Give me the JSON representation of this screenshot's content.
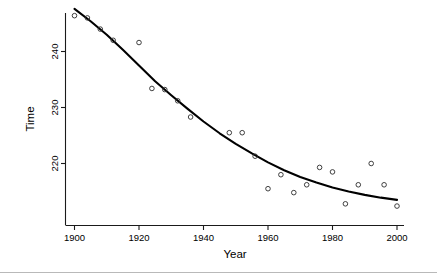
{
  "chart_data": {
    "type": "scatter",
    "title": "",
    "xlabel": "Year",
    "ylabel": "Time",
    "xlim": [
      1896,
      2004
    ],
    "ylim": [
      212,
      247
    ],
    "grid": false,
    "legend": null,
    "xticks": [
      1900,
      1920,
      1940,
      1960,
      1980,
      2000
    ],
    "xtick_labels": [
      "1900",
      "1920",
      "1940",
      "1960",
      "1980",
      "2000"
    ],
    "yticks": [
      220,
      230,
      240
    ],
    "ytick_labels": [
      "220",
      "230",
      "240"
    ],
    "marker": "open-circle",
    "series": [
      {
        "name": "observations",
        "x": [
          1900,
          1904,
          1908,
          1912,
          1920,
          1924,
          1928,
          1932,
          1936,
          1948,
          1952,
          1956,
          1960,
          1964,
          1968,
          1972,
          1976,
          1980,
          1984,
          1988,
          1992,
          1996,
          2000
        ],
        "y": [
          246.4,
          246.0,
          244.0,
          242.0,
          241.6,
          233.4,
          233.2,
          231.2,
          228.3,
          225.5,
          225.5,
          221.3,
          215.5,
          218.0,
          214.8,
          216.2,
          219.3,
          218.5,
          212.8,
          216.2,
          220.0,
          216.2,
          212.4
        ]
      }
    ],
    "fit": {
      "name": "fitted-curve",
      "type": "smooth-decay",
      "x": [
        1900,
        1905,
        1910,
        1915,
        1920,
        1925,
        1930,
        1935,
        1940,
        1945,
        1950,
        1955,
        1960,
        1965,
        1970,
        1975,
        1980,
        1985,
        1990,
        1995,
        2000
      ],
      "y": [
        247.6,
        245.4,
        243.0,
        240.3,
        237.5,
        234.7,
        232.2,
        229.8,
        227.5,
        225.4,
        223.5,
        221.8,
        220.2,
        218.8,
        217.6,
        216.6,
        215.7,
        215.0,
        214.4,
        213.9,
        213.5
      ]
    }
  },
  "axes": {
    "x_title": "Year",
    "y_title": "Time"
  }
}
